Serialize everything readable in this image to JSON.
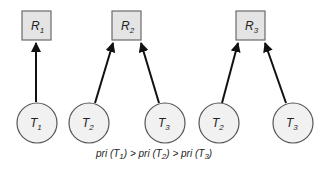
{
  "diagram": {
    "type": "resource-allocation",
    "groups": [
      {
        "resource": {
          "name": "R",
          "sub": "1"
        },
        "tasks": [
          {
            "name": "T",
            "sub": "1"
          }
        ]
      },
      {
        "resource": {
          "name": "R",
          "sub": "2"
        },
        "tasks": [
          {
            "name": "T",
            "sub": "2"
          },
          {
            "name": "T",
            "sub": "3"
          }
        ]
      },
      {
        "resource": {
          "name": "R",
          "sub": "3"
        },
        "tasks": [
          {
            "name": "T",
            "sub": "2"
          },
          {
            "name": "T",
            "sub": "3"
          }
        ]
      }
    ],
    "edges": [
      {
        "from": "T1",
        "to": "R1"
      },
      {
        "from": "T2",
        "to": "R2"
      },
      {
        "from": "T3",
        "to": "R2"
      },
      {
        "from": "T2",
        "to": "R3"
      },
      {
        "from": "T3",
        "to": "R3"
      }
    ],
    "caption": {
      "p1": "pri (T",
      "s1": "1",
      "p2": ") > pri (T",
      "s2": "2",
      "p3": ") > pri (T",
      "s3": "3",
      "p4": ")"
    },
    "colors": {
      "box_fill": "#e4e4e4",
      "circle_fill": "#f1f1f1",
      "edge": "#111111"
    }
  }
}
